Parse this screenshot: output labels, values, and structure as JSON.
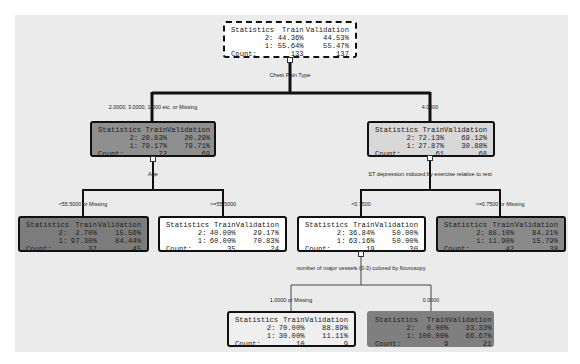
{
  "colors": {
    "canvas": "#ebebeb",
    "white_node": "#ffffff",
    "light_node": "#e4e4e4",
    "mid_node": "#c9c9c9",
    "dark_node": "#8f8f8f",
    "darker_node": "#7c7c7c"
  },
  "header": {
    "statistic": "Statistics",
    "train": "Train",
    "validation": "Validation"
  },
  "row_labels": {
    "class2": "2:",
    "class1": "1:",
    "count": "Count:"
  },
  "nodes": {
    "root": {
      "c2": [
        "44.36%",
        "44.53%"
      ],
      "c1": [
        "55.64%",
        "55.47%"
      ],
      "count": [
        "133",
        "137"
      ],
      "split": "Chest Pain Type"
    },
    "left": {
      "edge": "2.0000, 3.0000, 1.000 etc. or Missing",
      "c2": [
        "20.83%",
        "20.29%"
      ],
      "c1": [
        "79.17%",
        "79.71%"
      ],
      "count": [
        "72",
        "69"
      ],
      "split": "Age"
    },
    "right": {
      "edge": "4.0000",
      "c2": [
        "72.13%",
        "69.12%"
      ],
      "c1": [
        "27.87%",
        "30.88%"
      ],
      "count": [
        "61",
        "68"
      ],
      "split": "ST depression induced by exercise relative to rest"
    },
    "left_left": {
      "edge": "<55.5000 or Missing",
      "c2": [
        "2.70%",
        "15.56%"
      ],
      "c1": [
        "97.30%",
        "84.44%"
      ],
      "count": [
        "37",
        "45"
      ]
    },
    "left_right": {
      "edge": ">=55.5000",
      "c2": [
        "40.00%",
        "29.17%"
      ],
      "c1": [
        "60.00%",
        "70.83%"
      ],
      "count": [
        "35",
        "24"
      ]
    },
    "right_left": {
      "edge": "<0.7500",
      "c2": [
        "36.84%",
        "50.00%"
      ],
      "c1": [
        "63.16%",
        "50.00%"
      ],
      "count": [
        "19",
        "30"
      ],
      "split": "number of major vessels (0-3) colored by flourosopy"
    },
    "right_right": {
      "edge": ">=0.7500 or Missing",
      "c2": [
        "88.10%",
        "84.21%"
      ],
      "c1": [
        "11.90%",
        "15.79%"
      ],
      "count": [
        "42",
        "38"
      ]
    },
    "rl_left": {
      "edge": "1.0000 or Missing",
      "c2": [
        "70.00%",
        "88.89%"
      ],
      "c1": [
        "30.00%",
        "11.11%"
      ],
      "count": [
        "10",
        "9"
      ]
    },
    "rl_right": {
      "edge": "0.0000",
      "c2": [
        "0.00%",
        "33.33%"
      ],
      "c1": [
        "100.00%",
        "66.67%"
      ],
      "count": [
        "9",
        "21"
      ]
    }
  }
}
